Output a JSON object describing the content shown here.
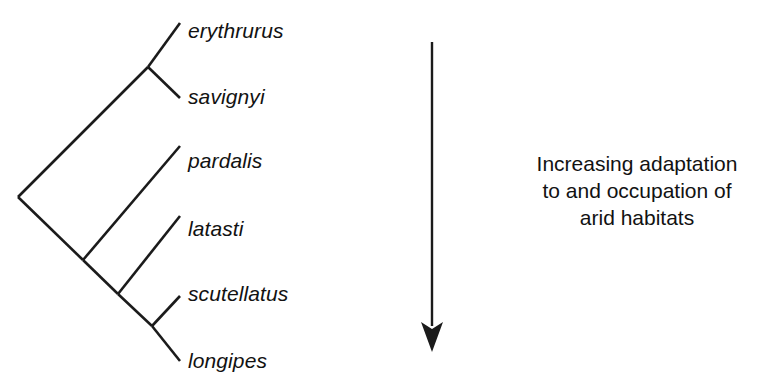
{
  "figure": {
    "name": "phylogenetic-cladogram-with-adaptation-gradient",
    "background_color": "#ffffff",
    "line_color": "#1b1b1b"
  },
  "cladogram": {
    "type": "cladogram",
    "orientation": "diagonal-ladder-right",
    "root": {
      "x": 18,
      "y": 197
    },
    "taxa": [
      {
        "name": "erythrurus",
        "label": "erythrurus",
        "tip": {
          "x": 180,
          "y": 23
        },
        "label_pos": {
          "x": 188,
          "y": 20
        }
      },
      {
        "name": "savignyi",
        "label": "savignyi",
        "tip": {
          "x": 180,
          "y": 98
        },
        "label_pos": {
          "x": 188,
          "y": 86
        }
      },
      {
        "name": "pardalis",
        "label": "pardalis",
        "tip": {
          "x": 180,
          "y": 146
        },
        "label_pos": {
          "x": 188,
          "y": 150
        }
      },
      {
        "name": "latasti",
        "label": "latasti",
        "tip": {
          "x": 180,
          "y": 216
        },
        "label_pos": {
          "x": 188,
          "y": 218
        }
      },
      {
        "name": "scutellatus",
        "label": "scutellatus",
        "tip": {
          "x": 180,
          "y": 296
        },
        "label_pos": {
          "x": 188,
          "y": 283
        }
      },
      {
        "name": "longipes",
        "label": "longipes",
        "tip": {
          "x": 180,
          "y": 361
        },
        "label_pos": {
          "x": 188,
          "y": 350
        }
      }
    ],
    "internal_nodes": [
      {
        "name": "node-root",
        "x": 18,
        "y": 197,
        "children": [
          "node-erythrurus-savignyi",
          "node-arid-clade"
        ]
      },
      {
        "name": "node-erythrurus-savignyi",
        "x": 148,
        "y": 67,
        "children": [
          "erythrurus",
          "savignyi"
        ]
      },
      {
        "name": "node-arid-clade",
        "x": 83,
        "y": 260,
        "children": [
          "pardalis",
          "node-latasti-group"
        ]
      },
      {
        "name": "node-latasti-group",
        "x": 118,
        "y": 294,
        "children": [
          "latasti",
          "node-scutellatus-longipes"
        ]
      },
      {
        "name": "node-scutellatus-longipes",
        "x": 152,
        "y": 326,
        "children": [
          "scutellatus",
          "longipes"
        ]
      }
    ]
  },
  "arrow": {
    "name": "increasing-adaptation-arrow",
    "direction": "down",
    "x": 432,
    "start_y": 42,
    "end_y": 352,
    "head_width": 22,
    "head_height": 28
  },
  "caption": {
    "lines": [
      "Increasing adaptation",
      "to and occupation of",
      "arid habitats"
    ],
    "line1": "Increasing adaptation",
    "line2": "to and occupation of",
    "line3": "arid habitats"
  }
}
